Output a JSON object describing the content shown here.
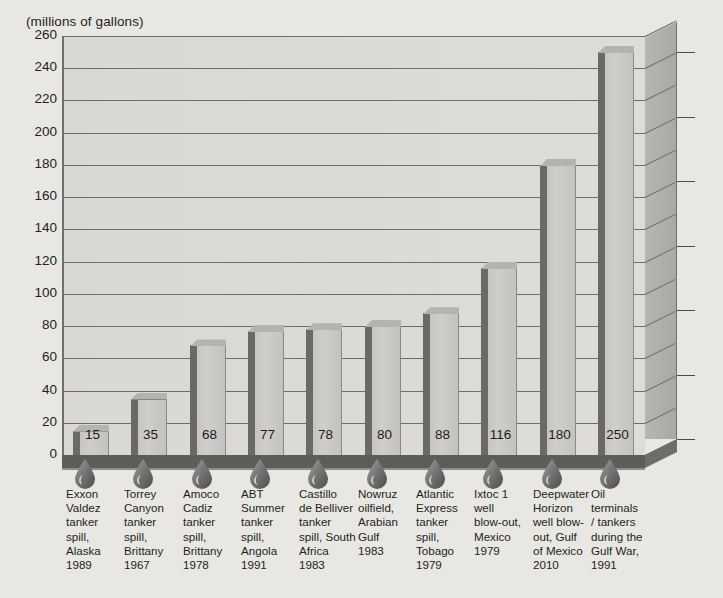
{
  "axis_title": "(millions of gallons)",
  "chart_data": {
    "type": "bar",
    "title": "(millions of gallons)",
    "xlabel": "",
    "ylabel": "millions of gallons",
    "ylim": [
      0,
      260
    ],
    "yticks": [
      0,
      20,
      40,
      60,
      80,
      100,
      120,
      140,
      160,
      180,
      200,
      220,
      240,
      260
    ],
    "grid": true,
    "legend": "none",
    "style": "3d-bar",
    "categories": [
      "Exxon Valdez tanker spill, Alaska 1989",
      "Torrey Canyon tanker spill, Brittany 1967",
      "Amoco Cadiz tanker spill, Brittany 1978",
      "ABT Summer tanker spill, Angola 1991",
      "Castillo de Belliver tanker spill, South Africa 1983",
      "Nowruz oilfield, Arabian Gulf 1983",
      "Atlantic Express tanker spill, Tobago 1979",
      "Ixtoc 1 well blow-out, Mexico 1979",
      "Deepwater Horizon well blow-out, Gulf of Mexico 2010",
      "Oil terminals / tankers during the Gulf War, 1991"
    ],
    "values": [
      15,
      35,
      68,
      77,
      78,
      80,
      88,
      116,
      180,
      250
    ]
  },
  "bars": [
    {
      "value": 15,
      "label_lines": [
        "Exxon",
        "Valdez",
        "tanker",
        "spill,",
        "Alaska",
        "1989"
      ],
      "icon": "oil-drop-icon"
    },
    {
      "value": 35,
      "label_lines": [
        "Torrey",
        "Canyon",
        "tanker",
        "spill,",
        "Brittany",
        "1967"
      ],
      "icon": "oil-drop-icon"
    },
    {
      "value": 68,
      "label_lines": [
        "Amoco",
        "Cadiz",
        "tanker",
        "spill,",
        "Brittany",
        "1978"
      ],
      "icon": "oil-drop-icon"
    },
    {
      "value": 77,
      "label_lines": [
        "ABT",
        "Summer",
        "tanker",
        "spill,",
        "Angola",
        "1991"
      ],
      "icon": "oil-drop-icon"
    },
    {
      "value": 78,
      "label_lines": [
        "Castillo",
        "de Belliver",
        "tanker",
        "spill, South",
        "Africa",
        "1983"
      ],
      "icon": "oil-drop-icon"
    },
    {
      "value": 80,
      "label_lines": [
        "Nowruz",
        "oilfield,",
        "Arabian",
        "Gulf",
        "1983"
      ],
      "icon": "oil-drop-icon"
    },
    {
      "value": 88,
      "label_lines": [
        "Atlantic",
        "Express",
        "tanker",
        "spill,",
        "Tobago",
        "1979"
      ],
      "icon": "oil-drop-icon"
    },
    {
      "value": 116,
      "label_lines": [
        "Ixtoc 1",
        "well",
        "blow-out,",
        "Mexico",
        "1979"
      ],
      "icon": "oil-drop-icon"
    },
    {
      "value": 180,
      "label_lines": [
        "Deepwater",
        "Horizon",
        "well blow-",
        "out, Gulf",
        "of Mexico",
        "2010"
      ],
      "icon": "oil-drop-icon"
    },
    {
      "value": 250,
      "label_lines": [
        "Oil",
        "terminals",
        "/ tankers",
        "during the",
        "Gulf War,",
        "1991"
      ],
      "icon": "oil-drop-icon"
    }
  ],
  "colors": {
    "background": "#e8e7e3",
    "plot_face": "#dddcd8",
    "bar_front": "#cfcecb",
    "bar_side": "#6a6967",
    "wall": "#b0afab",
    "floor": "#5d5c5a",
    "grid": "#6e6d6b",
    "text": "#231f20"
  }
}
